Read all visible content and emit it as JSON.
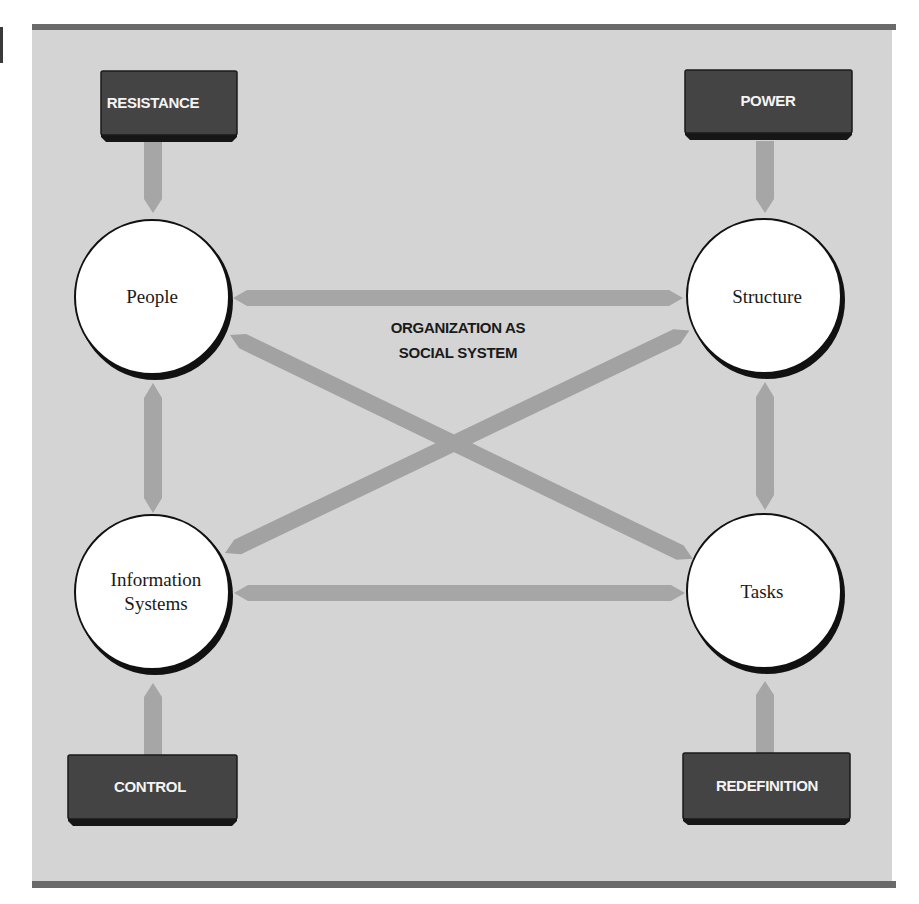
{
  "figure": {
    "center_label_lines": [
      "ORGANIZATION AS",
      "SOCIAL SYSTEM"
    ],
    "colors": {
      "panel_background": "#d4d4d4",
      "rule": "#6a6a6a",
      "box_fill": "#444444",
      "box_text": "#f4f4f4",
      "arrow": "#a6a6a6",
      "circle_fill": "#ffffff",
      "circle_outline": "#111111"
    }
  },
  "nodes": {
    "people": {
      "label_lines": [
        "People"
      ]
    },
    "structure": {
      "label_lines": [
        "Structure"
      ]
    },
    "information_systems": {
      "label_lines": [
        "Information",
        "Systems"
      ]
    },
    "tasks": {
      "label_lines": [
        "Tasks"
      ]
    }
  },
  "forces": {
    "resistance": {
      "label": "RESISTANCE",
      "target": "People"
    },
    "power": {
      "label": "POWER",
      "target": "Structure"
    },
    "control": {
      "label": "CONTROL",
      "target": "Information Systems"
    },
    "redefinition": {
      "label": "REDEFINITION",
      "target": "Tasks"
    }
  },
  "connections": [
    {
      "from": "People",
      "to": "Structure",
      "type": "bidirectional"
    },
    {
      "from": "Information Systems",
      "to": "Tasks",
      "type": "bidirectional"
    },
    {
      "from": "People",
      "to": "Information Systems",
      "type": "bidirectional"
    },
    {
      "from": "Structure",
      "to": "Tasks",
      "type": "bidirectional"
    },
    {
      "from": "People",
      "to": "Tasks",
      "type": "bidirectional"
    },
    {
      "from": "Information Systems",
      "to": "Structure",
      "type": "bidirectional"
    },
    {
      "from": "RESISTANCE",
      "to": "People",
      "type": "unidirectional"
    },
    {
      "from": "POWER",
      "to": "Structure",
      "type": "unidirectional"
    },
    {
      "from": "CONTROL",
      "to": "Information Systems",
      "type": "unidirectional"
    },
    {
      "from": "REDEFINITION",
      "to": "Tasks",
      "type": "unidirectional"
    }
  ]
}
